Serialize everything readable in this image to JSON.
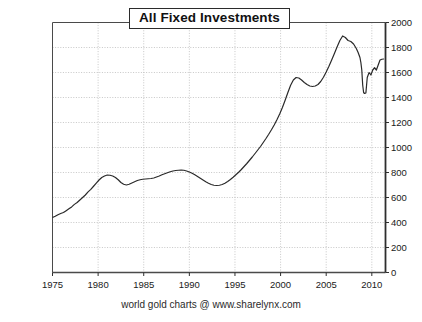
{
  "chart_data": {
    "type": "line",
    "title": "All Fixed Investments",
    "subtitle": "",
    "xlabel": "",
    "ylabel": "",
    "footer": "world gold charts @ www.sharelynx.com",
    "xlim": [
      1975,
      2011.5
    ],
    "ylim": [
      0,
      2000
    ],
    "xticks": [
      1975,
      1980,
      1985,
      1990,
      1995,
      2000,
      2005,
      2010
    ],
    "xtick_labels": [
      "1975",
      "1980",
      "1985",
      "1990",
      "1995",
      "2000",
      "2005",
      "2010"
    ],
    "yticks": [
      0,
      200,
      400,
      600,
      800,
      1000,
      1200,
      1400,
      1600,
      1800,
      2000
    ],
    "ytick_labels": [
      "0",
      "200",
      "400",
      "600",
      "800",
      "1000",
      "1200",
      "1400",
      "1600",
      "1800",
      "2000"
    ],
    "y_axis_side": "right",
    "grid": true,
    "grid_style": "dotted",
    "legend": "none",
    "line_color": "#2a2a2a",
    "line_width": 1.2,
    "series": [
      {
        "name": "All Fixed Investments",
        "x": [
          1975.0,
          1975.3,
          1975.6,
          1975.9,
          1976.2,
          1976.5,
          1976.8,
          1977.1,
          1977.4,
          1977.7,
          1978.0,
          1978.3,
          1978.6,
          1978.9,
          1979.2,
          1979.5,
          1979.8,
          1980.1,
          1980.4,
          1980.7,
          1981.0,
          1981.3,
          1981.6,
          1981.9,
          1982.2,
          1982.5,
          1982.8,
          1983.1,
          1983.4,
          1983.7,
          1984.0,
          1984.3,
          1984.6,
          1984.9,
          1985.2,
          1985.5,
          1985.8,
          1986.1,
          1986.4,
          1986.7,
          1987.0,
          1987.3,
          1987.6,
          1987.9,
          1988.2,
          1988.5,
          1988.8,
          1989.1,
          1989.4,
          1989.7,
          1990.0,
          1990.3,
          1990.6,
          1990.9,
          1991.2,
          1991.5,
          1991.8,
          1992.1,
          1992.4,
          1992.7,
          1993.0,
          1993.3,
          1993.6,
          1993.9,
          1994.2,
          1994.5,
          1994.8,
          1995.1,
          1995.4,
          1995.7,
          1996.0,
          1996.3,
          1996.6,
          1996.9,
          1997.2,
          1997.5,
          1997.8,
          1998.1,
          1998.4,
          1998.7,
          1999.0,
          1999.3,
          1999.6,
          1999.9,
          2000.2,
          2000.5,
          2000.8,
          2001.1,
          2001.4,
          2001.7,
          2002.0,
          2002.3,
          2002.6,
          2002.9,
          2003.2,
          2003.5,
          2003.8,
          2004.1,
          2004.4,
          2004.7,
          2005.0,
          2005.3,
          2005.6,
          2005.9,
          2006.2,
          2006.5,
          2006.8,
          2007.1,
          2007.4,
          2007.7,
          2008.0,
          2008.3,
          2008.5,
          2008.7,
          2008.8,
          2008.9,
          2009.0,
          2009.1,
          2009.2,
          2009.35,
          2009.5,
          2009.7,
          2009.9,
          2010.1,
          2010.3,
          2010.5,
          2010.7,
          2010.9,
          2011.1,
          2011.3
        ],
        "y": [
          440,
          450,
          462,
          472,
          480,
          495,
          510,
          525,
          545,
          560,
          580,
          600,
          620,
          645,
          665,
          690,
          715,
          740,
          760,
          772,
          780,
          778,
          772,
          760,
          742,
          720,
          706,
          700,
          706,
          716,
          726,
          736,
          742,
          746,
          748,
          750,
          752,
          756,
          764,
          772,
          782,
          790,
          798,
          806,
          812,
          816,
          818,
          820,
          818,
          812,
          804,
          794,
          782,
          768,
          754,
          740,
          726,
          714,
          704,
          698,
          696,
          698,
          704,
          714,
          728,
          744,
          762,
          782,
          802,
          824,
          848,
          872,
          898,
          924,
          952,
          980,
          1008,
          1040,
          1072,
          1106,
          1142,
          1180,
          1222,
          1268,
          1320,
          1378,
          1440,
          1498,
          1540,
          1560,
          1556,
          1540,
          1520,
          1504,
          1492,
          1488,
          1492,
          1504,
          1528,
          1562,
          1604,
          1650,
          1700,
          1752,
          1806,
          1856,
          1892,
          1880,
          1856,
          1848,
          1828,
          1792,
          1760,
          1720,
          1680,
          1620,
          1500,
          1440,
          1432,
          1436,
          1560,
          1600,
          1580,
          1620,
          1638,
          1620,
          1660,
          1700,
          1706,
          1708
        ]
      }
    ],
    "annotations": [
      {
        "label": "peak",
        "x": 2006.5,
        "y": 1892
      },
      {
        "label": "crash-trough",
        "x": 2009.2,
        "y": 1432
      },
      {
        "label": "start",
        "x": 1975.0,
        "y": 440
      }
    ]
  }
}
